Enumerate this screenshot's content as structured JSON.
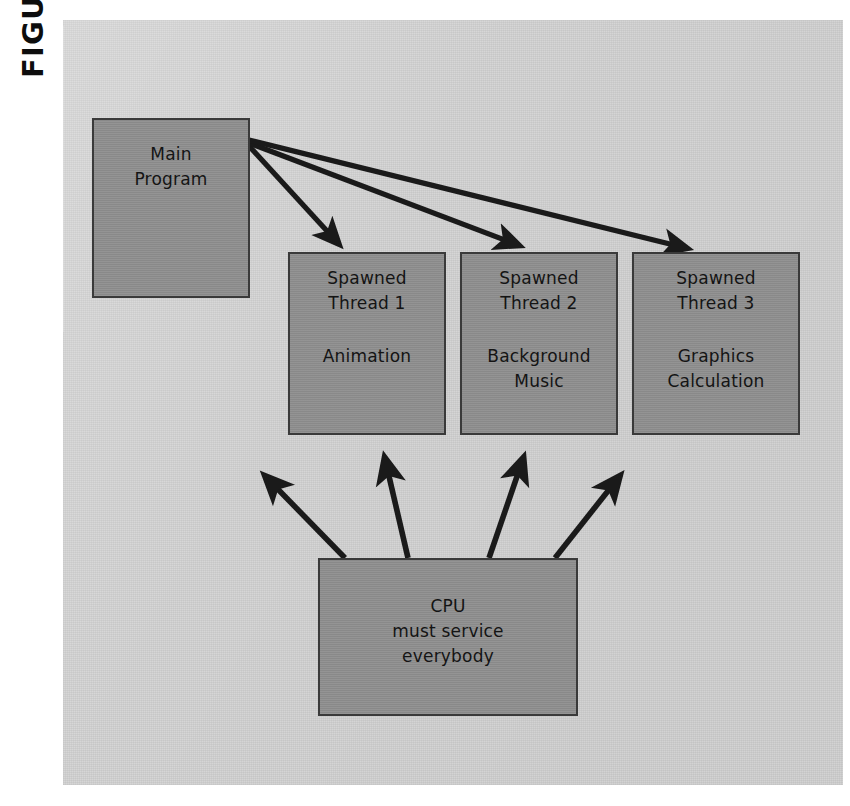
{
  "figure": {
    "label": "FIGURE 8-6",
    "canvas_color": "#d4d4d4",
    "box_fill_color": "#8e8e8e",
    "box_border_color": "#3a3a3a",
    "arrow_color": "#1a1a1a"
  },
  "boxes": {
    "main": {
      "line1": "Main",
      "line2": "Program"
    },
    "thread1": {
      "line1": "Spawned",
      "line2": "Thread 1",
      "line3": "Animation",
      "line4": ""
    },
    "thread2": {
      "line1": "Spawned",
      "line2": "Thread 2",
      "line3": "Background",
      "line4": "Music"
    },
    "thread3": {
      "line1": "Spawned",
      "line2": "Thread 3",
      "line3": "Graphics",
      "line4": "Calculation"
    },
    "cpu": {
      "line1": "CPU",
      "line2": "must service",
      "line3": "everybody"
    }
  },
  "bleed_through": {
    "line1": "",
    "line2": "",
    "line3": ""
  }
}
